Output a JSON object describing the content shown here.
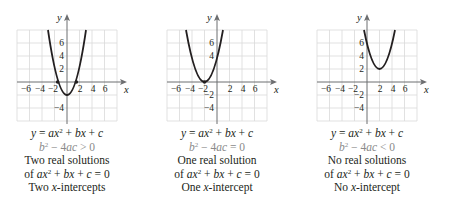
{
  "figure": {
    "grid": {
      "x_range": [
        -8,
        8
      ],
      "y_range": [
        -6,
        8
      ],
      "cell_units": 2,
      "x_tick_labels": [
        "−6",
        "−4",
        "−2",
        "2",
        "4",
        "6"
      ],
      "x_tick_values": [
        -6,
        -4,
        -2,
        2,
        4,
        6
      ],
      "y_tick_labels": [
        "6",
        "4",
        "2",
        "−2",
        "−4"
      ],
      "y_tick_values": [
        6,
        4,
        2,
        -2,
        -4
      ],
      "x_axis_label": "x",
      "y_axis_label": "y",
      "grid_color": "#d9d9d9",
      "axis_color": "#6d6e70",
      "curve_color": "#231f20"
    },
    "panels": [
      {
        "id": "two-solutions",
        "equation": "y = ax² + bx + c",
        "discriminant": "b² − 4ac > 0",
        "solutions_text": "Two real solutions",
        "equation_zero": "of ax² + bx + c = 0",
        "intercepts_text": "Two x-intercepts",
        "vertex": [
          0,
          -2
        ],
        "x_intercepts": [
          -1.5,
          1.5
        ],
        "y_tick_labels_shown": [
          "6",
          "4",
          "2",
          "−4"
        ]
      },
      {
        "id": "one-solution",
        "equation": "y = ax² + bx + c",
        "discriminant": "b² − 4ac = 0",
        "solutions_text": "One real solution",
        "equation_zero": "of ax² + bx + c = 0",
        "intercepts_text": "One x-intercept",
        "vertex": [
          -2,
          0
        ],
        "x_intercepts": [
          -2
        ],
        "y_tick_labels_shown": [
          "6",
          "4",
          "−2",
          "−4"
        ]
      },
      {
        "id": "no-solutions",
        "equation": "y = ax² + bx + c",
        "discriminant": "b² − 4ac < 0",
        "solutions_text": "No real solutions",
        "equation_zero": "of ax² + bx + c = 0",
        "intercepts_text": "No x-intercept",
        "vertex": [
          2,
          2
        ],
        "x_intercepts": [],
        "y_tick_labels_shown": [
          "6",
          "4",
          "2",
          "−2",
          "−4"
        ]
      }
    ]
  }
}
